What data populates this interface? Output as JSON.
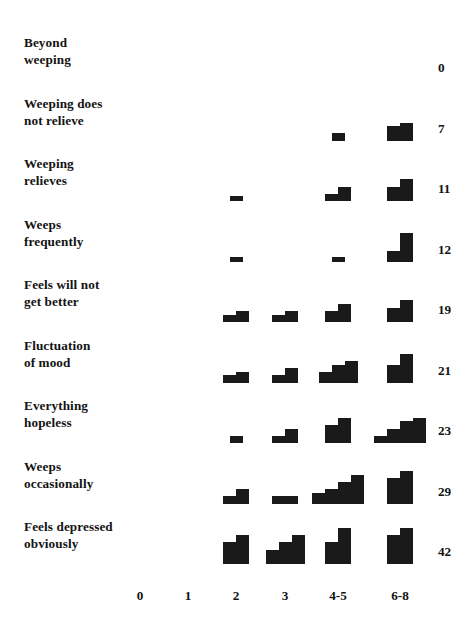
{
  "chart_data": {
    "type": "bar",
    "title": "",
    "subtitle": "",
    "xlabel": "",
    "ylabel": "",
    "grid": false,
    "legend": null,
    "categories": [
      "0",
      "1",
      "2",
      "3",
      "4-5",
      "6-8"
    ],
    "category_centers_px": [
      140,
      188,
      236,
      285,
      338,
      400
    ],
    "row_total_header": "",
    "note": "Scalogram: each row is a symptom item; each column is a score group; each cell is a mini histogram of sub-bars; right-hand number is the row total count.",
    "series": [
      {
        "name": "Beyond weeping",
        "label_lines": "Beyond\nweeping",
        "total": 0,
        "values": [
          0,
          0,
          0,
          0,
          0,
          0
        ],
        "cells": [
          {
            "category": "0",
            "subbars": []
          },
          {
            "category": "1",
            "subbars": []
          },
          {
            "category": "2",
            "subbars": []
          },
          {
            "category": "3",
            "subbars": []
          },
          {
            "category": "4-5",
            "subbars": []
          },
          {
            "category": "6-8",
            "subbars": []
          }
        ]
      },
      {
        "name": "Weeping does not relieve",
        "label_lines": "Weeping does\nnot relieve",
        "total": 7,
        "values": [
          0,
          0,
          0,
          0,
          2,
          5
        ],
        "cells": [
          {
            "category": "0",
            "subbars": []
          },
          {
            "category": "1",
            "subbars": []
          },
          {
            "category": "2",
            "subbars": []
          },
          {
            "category": "3",
            "subbars": []
          },
          {
            "category": "4-5",
            "subbars": [
              2
            ]
          },
          {
            "category": "6-8",
            "subbars": [
              4,
              5
            ]
          }
        ]
      },
      {
        "name": "Weeping relieves",
        "label_lines": "Weeping\nrelieves",
        "total": 11,
        "values": [
          0,
          0,
          1,
          0,
          4,
          6
        ],
        "cells": [
          {
            "category": "0",
            "subbars": []
          },
          {
            "category": "1",
            "subbars": []
          },
          {
            "category": "2",
            "subbars": [
              1
            ]
          },
          {
            "category": "3",
            "subbars": []
          },
          {
            "category": "4-5",
            "subbars": [
              2,
              4
            ]
          },
          {
            "category": "6-8",
            "subbars": [
              4,
              6
            ]
          }
        ]
      },
      {
        "name": "Weeps frequently",
        "label_lines": "Weeps\nfrequently",
        "total": 12,
        "values": [
          0,
          0,
          1,
          0,
          1,
          10
        ],
        "cells": [
          {
            "category": "0",
            "subbars": []
          },
          {
            "category": "1",
            "subbars": []
          },
          {
            "category": "2",
            "subbars": [
              1
            ]
          },
          {
            "category": "3",
            "subbars": []
          },
          {
            "category": "4-5",
            "subbars": [
              1
            ]
          },
          {
            "category": "6-8",
            "subbars": [
              3,
              8
            ]
          }
        ]
      },
      {
        "name": "Feels will not get better",
        "label_lines": "Feels will not\nget better",
        "total": 19,
        "values": [
          0,
          0,
          3,
          3,
          6,
          7
        ],
        "cells": [
          {
            "category": "0",
            "subbars": []
          },
          {
            "category": "1",
            "subbars": []
          },
          {
            "category": "2",
            "subbars": [
              2,
              3
            ]
          },
          {
            "category": "3",
            "subbars": [
              2,
              3
            ]
          },
          {
            "category": "4-5",
            "subbars": [
              3,
              5
            ]
          },
          {
            "category": "6-8",
            "subbars": [
              4,
              6
            ]
          }
        ]
      },
      {
        "name": "Fluctuation of mood",
        "label_lines": "Fluctuation\nof mood",
        "total": 21,
        "values": [
          0,
          0,
          3,
          3,
          7,
          8
        ],
        "cells": [
          {
            "category": "0",
            "subbars": []
          },
          {
            "category": "1",
            "subbars": []
          },
          {
            "category": "2",
            "subbars": [
              2,
              3
            ]
          },
          {
            "category": "3",
            "subbars": [
              2,
              4
            ]
          },
          {
            "category": "4-5",
            "subbars": [
              3,
              5,
              6
            ]
          },
          {
            "category": "6-8",
            "subbars": [
              5,
              8
            ]
          }
        ]
      },
      {
        "name": "Everything hopeless",
        "label_lines": "Everything\nhopeless",
        "total": 23,
        "values": [
          0,
          0,
          2,
          4,
          8,
          9
        ],
        "cells": [
          {
            "category": "0",
            "subbars": []
          },
          {
            "category": "1",
            "subbars": []
          },
          {
            "category": "2",
            "subbars": [
              2
            ]
          },
          {
            "category": "3",
            "subbars": [
              2,
              4
            ]
          },
          {
            "category": "4-5",
            "subbars": [
              5,
              7
            ]
          },
          {
            "category": "6-8",
            "subbars": [
              2,
              4,
              6,
              7
            ]
          }
        ]
      },
      {
        "name": "Weeps occasionally",
        "label_lines": "Weeps\noccasionally",
        "total": 29,
        "values": [
          0,
          0,
          3,
          2,
          11,
          13
        ],
        "cells": [
          {
            "category": "0",
            "subbars": []
          },
          {
            "category": "1",
            "subbars": []
          },
          {
            "category": "2",
            "subbars": [
              2,
              4
            ]
          },
          {
            "category": "3",
            "subbars": [
              2,
              2
            ]
          },
          {
            "category": "4-5",
            "subbars": [
              3,
              4,
              6,
              8
            ]
          },
          {
            "category": "6-8",
            "subbars": [
              7,
              9
            ]
          }
        ]
      },
      {
        "name": "Feels depressed obviously",
        "label_lines": "Feels depressed\nobviously",
        "total": 42,
        "values": [
          0,
          0,
          7,
          7,
          13,
          15
        ],
        "cells": [
          {
            "category": "0",
            "subbars": []
          },
          {
            "category": "1",
            "subbars": []
          },
          {
            "category": "2",
            "subbars": [
              6,
              8
            ]
          },
          {
            "category": "3",
            "subbars": [
              4,
              6,
              8
            ]
          },
          {
            "category": "4-5",
            "subbars": [
              6,
              10
            ]
          },
          {
            "category": "6-8",
            "subbars": [
              8,
              10
            ]
          }
        ]
      }
    ]
  },
  "style": {
    "bar_color": "#1a1a1a",
    "text_color": "#131313",
    "background": "#ffffff"
  }
}
